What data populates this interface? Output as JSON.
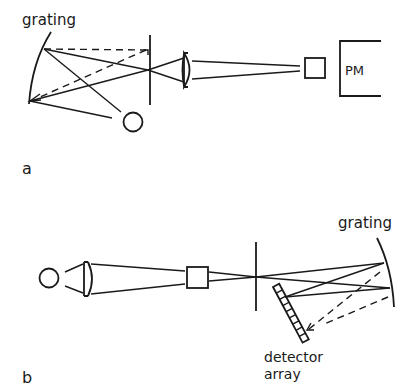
{
  "figure": {
    "panel_a": {
      "label": "a",
      "grating_label": "grating",
      "detector_label": "PM",
      "components": [
        "grating",
        "source-circle",
        "slit",
        "lens",
        "sample-cell",
        "photomultiplier"
      ]
    },
    "panel_b": {
      "label": "b",
      "grating_label": "grating",
      "detector_label_line1": "detector",
      "detector_label_line2": "array",
      "components": [
        "source-circle",
        "lens",
        "sample-cell",
        "slit",
        "grating",
        "detector-array"
      ]
    },
    "colors": {
      "line": "#1a1a1a",
      "background": "#ffffff"
    }
  }
}
